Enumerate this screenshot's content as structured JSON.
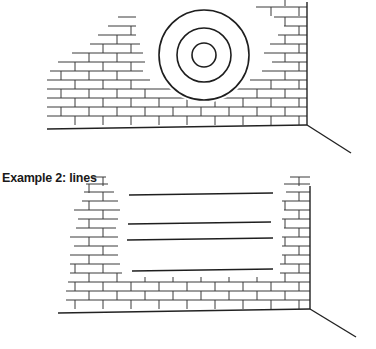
{
  "figures": [
    {
      "id": "example-1",
      "caption": "",
      "subject": "target",
      "target": {
        "cx": 204,
        "cy": 55,
        "radii": [
          45,
          27,
          12
        ]
      },
      "corner": {
        "x": 307,
        "top": 2,
        "bottom": 125
      },
      "floor": {
        "x1": 47,
        "y1": 129,
        "x2": 307,
        "y2": 125
      },
      "perspective_line": {
        "x1": 307,
        "y1": 125,
        "x2": 351,
        "y2": 153
      },
      "brick_height": 9,
      "courses": [
        {
          "y": 125,
          "x1": 47,
          "x2": 307,
          "offset": 0
        },
        {
          "y": 116,
          "x1": 47,
          "x2": 307,
          "offset": 14
        },
        {
          "y": 107,
          "x1": 47,
          "x2": 307,
          "offset": 0
        },
        {
          "y": 98,
          "x1": 47,
          "x2": 173,
          "offset": 14
        },
        {
          "y": 98,
          "x1": 230,
          "x2": 307,
          "offset": 14
        },
        {
          "y": 89,
          "x1": 47,
          "x2": 150,
          "offset": 0
        },
        {
          "y": 89,
          "x1": 250,
          "x2": 307,
          "offset": 0
        },
        {
          "y": 80,
          "x1": 50,
          "x2": 143,
          "offset": 14
        },
        {
          "y": 80,
          "x1": 262,
          "x2": 307,
          "offset": 14
        },
        {
          "y": 71,
          "x1": 58,
          "x2": 145,
          "offset": 0
        },
        {
          "y": 71,
          "x1": 272,
          "x2": 307,
          "offset": 0
        },
        {
          "y": 62,
          "x1": 72,
          "x2": 143,
          "offset": 14
        },
        {
          "y": 62,
          "x1": 264,
          "x2": 307,
          "offset": 14
        },
        {
          "y": 53,
          "x1": 90,
          "x2": 140,
          "offset": 0
        },
        {
          "y": 53,
          "x1": 270,
          "x2": 307,
          "offset": 0
        },
        {
          "y": 44,
          "x1": 98,
          "x2": 136,
          "offset": 14
        },
        {
          "y": 44,
          "x1": 278,
          "x2": 307,
          "offset": 14
        },
        {
          "y": 35,
          "x1": 108,
          "x2": 136,
          "offset": 0
        },
        {
          "y": 35,
          "x1": 284,
          "x2": 307,
          "offset": 0
        },
        {
          "y": 26,
          "x1": 118,
          "x2": 136,
          "offset": 14
        },
        {
          "y": 26,
          "x1": 274,
          "x2": 307,
          "offset": 14
        },
        {
          "y": 16,
          "x1": 256,
          "x2": 307,
          "offset": 0
        },
        {
          "y": 6,
          "x1": 272,
          "x2": 307,
          "offset": 14
        }
      ]
    },
    {
      "id": "example-2",
      "caption": "Example 2: lines",
      "subject": "lines",
      "lines": [
        {
          "x1": 129,
          "y1": 30,
          "x2": 273,
          "y2": 28
        },
        {
          "x1": 128,
          "y1": 59,
          "x2": 271,
          "y2": 57
        },
        {
          "x1": 127,
          "y1": 75,
          "x2": 273,
          "y2": 73
        },
        {
          "x1": 132,
          "y1": 106,
          "x2": 273,
          "y2": 104
        }
      ],
      "corner": {
        "x": 310,
        "top": 21,
        "bottom": 144
      },
      "floor": {
        "x1": 58,
        "y1": 148,
        "x2": 310,
        "y2": 144
      },
      "perspective_line": {
        "x1": 310,
        "y1": 144,
        "x2": 356,
        "y2": 172
      },
      "brick_height": 9,
      "courses": [
        {
          "y": 144,
          "x1": 66,
          "x2": 310,
          "offset": 0
        },
        {
          "y": 135,
          "x1": 66,
          "x2": 310,
          "offset": 14
        },
        {
          "y": 126,
          "x1": 68,
          "x2": 310,
          "offset": 0
        },
        {
          "y": 117,
          "x1": 70,
          "x2": 310,
          "offset": 14
        },
        {
          "y": 108,
          "x1": 70,
          "x2": 120,
          "offset": 0
        },
        {
          "y": 108,
          "x1": 252,
          "x2": 310,
          "offset": 0
        },
        {
          "y": 99,
          "x1": 70,
          "x2": 118,
          "offset": 14
        },
        {
          "y": 99,
          "x1": 282,
          "x2": 310,
          "offset": 14
        },
        {
          "y": 90,
          "x1": 74,
          "x2": 118,
          "offset": 0
        },
        {
          "y": 90,
          "x1": 282,
          "x2": 310,
          "offset": 0
        },
        {
          "y": 81,
          "x1": 70,
          "x2": 118,
          "offset": 14
        },
        {
          "y": 81,
          "x1": 282,
          "x2": 310,
          "offset": 14
        },
        {
          "y": 72,
          "x1": 76,
          "x2": 116,
          "offset": 0
        },
        {
          "y": 72,
          "x1": 284,
          "x2": 310,
          "offset": 0
        },
        {
          "y": 63,
          "x1": 78,
          "x2": 118,
          "offset": 14
        },
        {
          "y": 63,
          "x1": 282,
          "x2": 310,
          "offset": 14
        },
        {
          "y": 54,
          "x1": 74,
          "x2": 120,
          "offset": 0
        },
        {
          "y": 54,
          "x1": 284,
          "x2": 310,
          "offset": 0
        },
        {
          "y": 45,
          "x1": 82,
          "x2": 118,
          "offset": 14
        },
        {
          "y": 45,
          "x1": 282,
          "x2": 310,
          "offset": 14
        },
        {
          "y": 36,
          "x1": 84,
          "x2": 114,
          "offset": 0
        },
        {
          "y": 36,
          "x1": 286,
          "x2": 310,
          "offset": 0
        },
        {
          "y": 28,
          "x1": 86,
          "x2": 108,
          "offset": 14
        },
        {
          "y": 28,
          "x1": 284,
          "x2": 310,
          "offset": 14
        },
        {
          "y": 21,
          "x1": 92,
          "x2": 106,
          "offset": 0
        },
        {
          "y": 21,
          "x1": 290,
          "x2": 310,
          "offset": 0
        }
      ]
    }
  ]
}
